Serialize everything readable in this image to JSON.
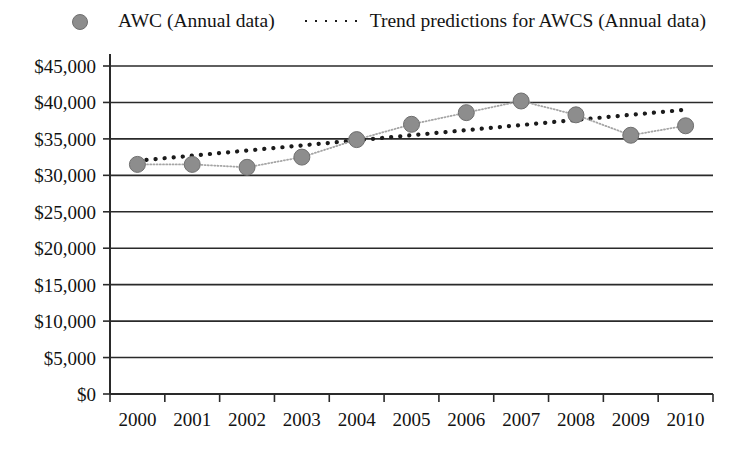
{
  "legend": {
    "position": "top-center",
    "items": [
      {
        "label": "AWC (Annual data)",
        "key": "series-line-marker",
        "color": "#8d8d8d"
      },
      {
        "label": "Trend predictions for AWCS (Annual data)",
        "key": "dotted-line",
        "color": "#1b1b1b"
      }
    ]
  },
  "axes": {
    "y_ticks": [
      "$0",
      "$5,000",
      "$10,000",
      "$15,000",
      "$20,000",
      "$25,000",
      "$30,000",
      "$35,000",
      "$40,000",
      "$45,000"
    ],
    "x_ticks": [
      "2000",
      "2001",
      "2002",
      "2003",
      "2004",
      "2005",
      "2006",
      "2007",
      "2008",
      "2009",
      "2010"
    ]
  },
  "chart_data": {
    "type": "line",
    "title": "",
    "subtitle": "",
    "xlabel": "",
    "ylabel": "",
    "ylim": [
      0,
      45000
    ],
    "ytick_step": 5000,
    "grid": true,
    "legend_position": "top-center",
    "categories": [
      "2000",
      "2001",
      "2002",
      "2003",
      "2004",
      "2005",
      "2006",
      "2007",
      "2008",
      "2009",
      "2010"
    ],
    "series": [
      {
        "name": "AWC (Annual data)",
        "style": "dotted-line-with-circle-markers",
        "color": "#8d8d8d",
        "values": [
          31500,
          31500,
          31100,
          32500,
          34900,
          37000,
          38600,
          40200,
          38300,
          35500,
          36800
        ]
      },
      {
        "name": "Trend predictions for AWCS (Annual data)",
        "style": "dotted-line",
        "color": "#1b1b1b",
        "values": [
          32000,
          32700,
          33400,
          34100,
          34800,
          35500,
          36200,
          36900,
          37600,
          38300,
          39000
        ]
      }
    ]
  }
}
